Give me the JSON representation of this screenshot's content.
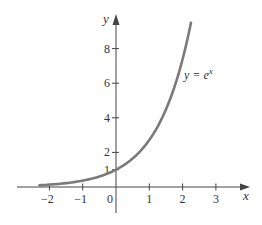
{
  "chart_data": {
    "type": "line",
    "title": "",
    "xlabel": "x",
    "ylabel": "y",
    "xlim": [
      -2.7,
      4.0
    ],
    "ylim": [
      -1.5,
      10.0
    ],
    "grid": false,
    "legend": "none",
    "x_ticks": [
      -2,
      -1,
      0,
      1,
      2,
      3
    ],
    "x_tick_labels": [
      "−2",
      "−1",
      "0",
      "1",
      "2",
      "3"
    ],
    "y_ticks": [
      1,
      2,
      4,
      6,
      8
    ],
    "y_tick_labels": [
      "1",
      "2",
      "4",
      "6",
      "8"
    ],
    "series": [
      {
        "name": "y = e^x",
        "function": "exp(x)",
        "x": [
          -2.3,
          -2,
          -1.5,
          -1,
          -0.5,
          0,
          0.5,
          1,
          1.5,
          2,
          2.25
        ],
        "values": [
          0.1,
          0.14,
          0.22,
          0.37,
          0.61,
          1.0,
          1.65,
          2.72,
          4.48,
          7.39,
          9.49
        ],
        "color": "#7a7a7a"
      }
    ],
    "annotations": [
      {
        "text": "y = e",
        "superscript": "x",
        "x": 2.1,
        "y": 6.5
      }
    ]
  },
  "labels": {
    "x_axis": "x",
    "y_axis": "y",
    "curve_y": "y",
    "curve_eq": " = e",
    "curve_sup": "x",
    "origin": "0"
  },
  "colors": {
    "axis": "#444444",
    "curve": "#7a7a7a"
  }
}
